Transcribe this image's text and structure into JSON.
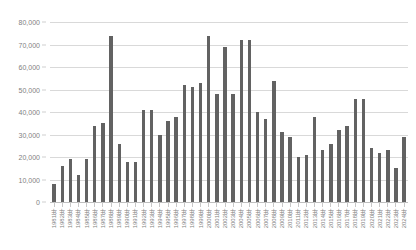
{
  "chart_data": {
    "type": "bar",
    "title": "",
    "xlabel": "",
    "ylabel": "",
    "ylim": [
      0,
      80000
    ],
    "ytick_labels": [
      "80,000",
      "70,000",
      "60,000",
      "50,000",
      "40,000",
      "30,000",
      "20,000",
      "10,000",
      "0"
    ],
    "ytick_values": [
      80000,
      70000,
      60000,
      50000,
      40000,
      30000,
      20000,
      10000,
      0
    ],
    "grid": true,
    "legend": null,
    "bar_color": "#626262",
    "grid_color": "#d9d9d9",
    "categories": [
      "1981年",
      "1982年",
      "1983年",
      "1984年",
      "1985年",
      "1986年",
      "1987年",
      "1988年",
      "1989年",
      "1990年",
      "1991年",
      "1992年",
      "1993年",
      "1994年",
      "1995年",
      "1996年",
      "1997年",
      "1998年",
      "1999年",
      "2000年",
      "2001年",
      "2002年",
      "2003年",
      "2004年",
      "2005年",
      "2006年",
      "2007年",
      "2008年",
      "2009年",
      "2010年",
      "2011年",
      "2012年",
      "2013年",
      "2014年",
      "2015年",
      "2016年",
      "2017年",
      "2018年",
      "2019年",
      "2020年",
      "2021年",
      "2022年",
      "2023年",
      "2024年"
    ],
    "values": [
      8000,
      16000,
      19000,
      12000,
      19000,
      34000,
      35000,
      74000,
      26000,
      18000,
      18000,
      41000,
      41000,
      30000,
      36000,
      38000,
      52000,
      51000,
      53000,
      74000,
      48000,
      69000,
      48000,
      72000,
      72000,
      40000,
      37000,
      54000,
      31000,
      29000,
      20000,
      21000,
      38000,
      23000,
      26000,
      32000,
      34000,
      46000,
      46000,
      24000,
      22000,
      23000,
      15000,
      29000
    ]
  }
}
